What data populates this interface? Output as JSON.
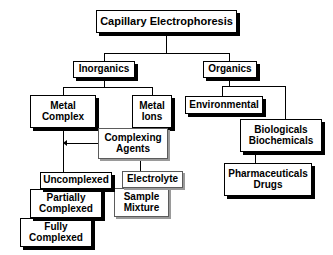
{
  "diagram": {
    "colors": {
      "box_fill": "#ffffff",
      "box_border": "#000000",
      "shadow": "#000000",
      "grey_border": "#5b5b5b",
      "grey_shadow": "#9a9a9a",
      "line": "#000000"
    },
    "nodes": {
      "root": {
        "lines": [
          "Capillary Electrophoresis"
        ]
      },
      "inorganics": {
        "lines": [
          "Inorganics"
        ]
      },
      "organics": {
        "lines": [
          "Organics"
        ]
      },
      "metal_complex": {
        "lines": [
          "Metal",
          "Complex"
        ]
      },
      "metal_ions": {
        "lines": [
          "Metal",
          "Ions"
        ]
      },
      "complexing": {
        "lines": [
          "Complexing",
          "Agents"
        ]
      },
      "environmental": {
        "lines": [
          "Environmental"
        ]
      },
      "biologicals": {
        "lines": [
          "Biologicals",
          "Biochemicals"
        ]
      },
      "pharmaceuticals": {
        "lines": [
          "Pharmaceuticals",
          "Drugs"
        ]
      },
      "uncomplexed": {
        "lines": [
          "Uncomplexed"
        ]
      },
      "partially": {
        "lines": [
          "Partially",
          "Complexed"
        ]
      },
      "fully": {
        "lines": [
          "Fully",
          "Complexed"
        ]
      },
      "electrolyte": {
        "lines": [
          "Electrolyte"
        ]
      },
      "sample_mixture": {
        "lines": [
          "Sample",
          "Mixture"
        ]
      }
    }
  }
}
